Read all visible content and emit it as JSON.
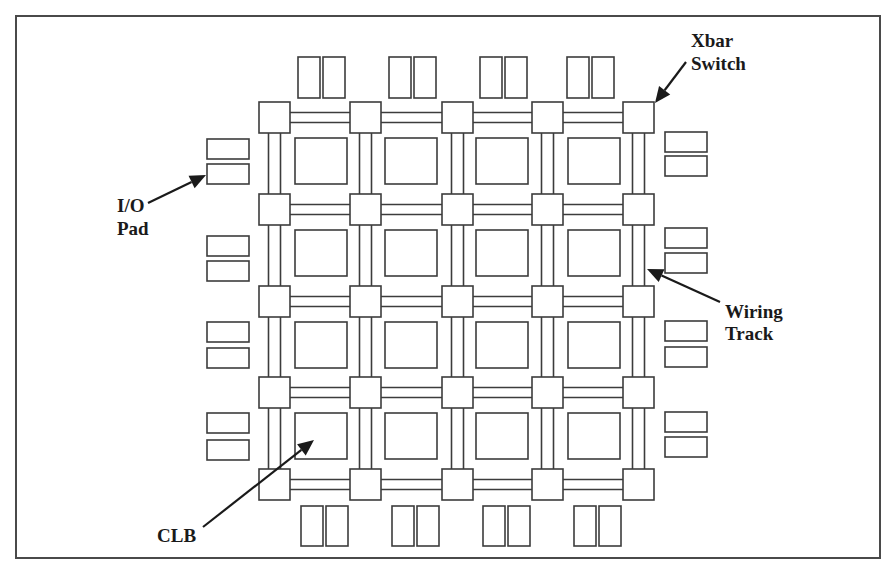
{
  "figure": {
    "frame": {
      "x": 16,
      "y": 16,
      "width": 864,
      "height": 542
    },
    "colors": {
      "stroke": "#3c3c3c",
      "frame": "#4a4a4a",
      "text": "#1a1a1a",
      "background": "#ffffff"
    }
  },
  "grid": {
    "switch_columns_x": [
      259,
      350,
      442,
      532,
      623
    ],
    "switch_rows_y": [
      102,
      194,
      286,
      377,
      469
    ],
    "switch_size": 31,
    "wire_gap": 10,
    "clb_columns_x": [
      295,
      385,
      476,
      568
    ],
    "clb_rows_y": [
      138,
      230,
      322,
      413
    ],
    "clb_width": 52,
    "clb_height": 46
  },
  "io_pads": {
    "top": {
      "y": 57,
      "height": 41,
      "width": 22,
      "pairs_x": [
        [
          298,
          323
        ],
        [
          389,
          414
        ],
        [
          480,
          505
        ],
        [
          567,
          592
        ]
      ]
    },
    "bottom": {
      "y": 506,
      "height": 40,
      "width": 22,
      "pairs_x": [
        [
          301,
          326
        ],
        [
          392,
          417
        ],
        [
          483,
          508
        ],
        [
          574,
          599
        ]
      ]
    },
    "left": {
      "x": 207,
      "width": 42,
      "height": 20,
      "pairs_y": [
        [
          139,
          164
        ],
        [
          236,
          261
        ],
        [
          322,
          348
        ],
        [
          413,
          440
        ]
      ]
    },
    "right": {
      "x": 665,
      "width": 42,
      "height": 20,
      "pairs_y": [
        [
          132,
          156
        ],
        [
          228,
          253
        ],
        [
          321,
          347
        ],
        [
          412,
          437
        ]
      ]
    }
  },
  "labels": {
    "xbar": {
      "lines": [
        "Xbar",
        "Switch"
      ],
      "x": 691,
      "y": [
        47,
        70
      ]
    },
    "io_pad": {
      "lines": [
        "I/O",
        "Pad"
      ],
      "x": 117,
      "y": [
        212,
        235
      ]
    },
    "wiring_track": {
      "lines": [
        "Wiring",
        "Track"
      ],
      "x": 725,
      "y": [
        318,
        340
      ]
    },
    "clb": {
      "lines": [
        "CLB"
      ],
      "x": 157,
      "y": [
        542
      ]
    }
  },
  "arrows": [
    {
      "name": "xbar-switch-arrow",
      "from": [
        686,
        62
      ],
      "to": [
        655,
        103
      ]
    },
    {
      "name": "io-pad-arrow",
      "from": [
        148,
        203
      ],
      "to": [
        206,
        175
      ]
    },
    {
      "name": "wiring-track-arrow",
      "from": [
        720,
        302
      ],
      "to": [
        647,
        269
      ]
    },
    {
      "name": "clb-arrow",
      "from": [
        203,
        527
      ],
      "to": [
        314,
        440
      ]
    }
  ]
}
